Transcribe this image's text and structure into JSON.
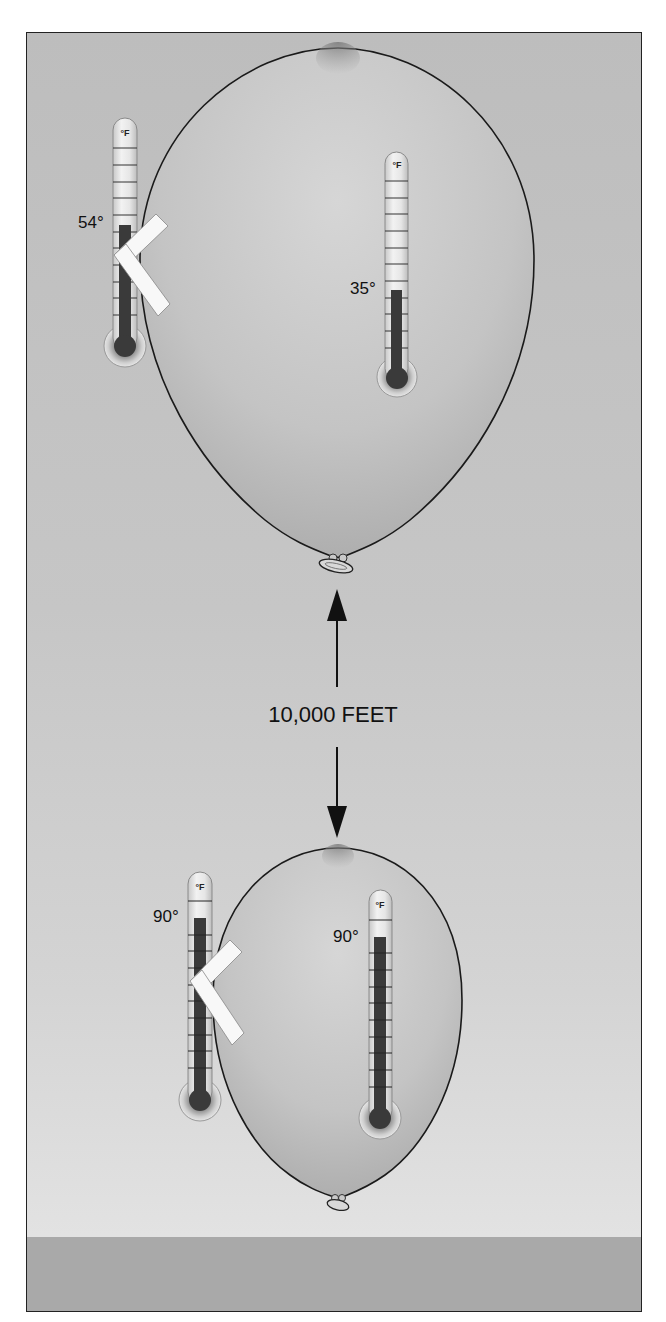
{
  "diagram": {
    "altitude_label": "10,000 FEET",
    "unit_label": "°F",
    "colors": {
      "background_top": "#bdbdbd",
      "background_bottom": "#e2e2e2",
      "ground": "#a9a9a9",
      "mercury": "#3a3a3a",
      "outline": "#1a1a1a",
      "tape": "#f8f8f8"
    },
    "upper_balloon": {
      "position": "high altitude",
      "outside_thermometer": {
        "reading": "54°",
        "attached_with_tape": true
      },
      "inside_thermometer": {
        "reading": "35°"
      }
    },
    "lower_balloon": {
      "position": "ground level",
      "outside_thermometer": {
        "reading": "90°",
        "attached_with_tape": true
      },
      "inside_thermometer": {
        "reading": "90°"
      }
    }
  }
}
